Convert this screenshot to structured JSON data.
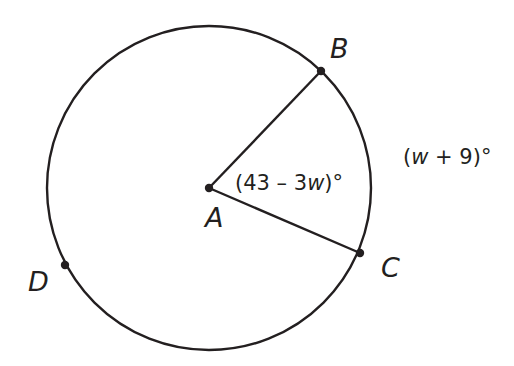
{
  "diagram": {
    "type": "circle-central-angle",
    "center": {
      "label": "A",
      "x": 209,
      "y": 188
    },
    "radius": 162,
    "points": [
      {
        "label": "B",
        "x": 321,
        "y": 71
      },
      {
        "label": "C",
        "x": 360,
        "y": 253
      },
      {
        "label": "D",
        "x": 65,
        "y": 265
      }
    ],
    "angle_label": {
      "prefix": "(43 – 3",
      "var": "w",
      "suffix": ")°"
    },
    "arc_label": {
      "prefix": "(",
      "var": "w",
      "suffix": " + 9)°"
    },
    "stroke_color": "#231f20"
  }
}
